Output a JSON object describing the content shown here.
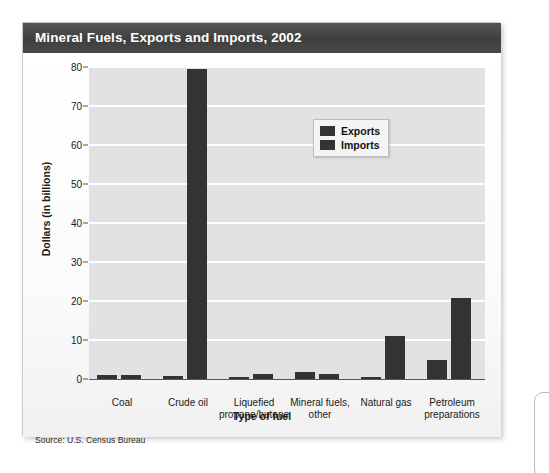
{
  "card": {
    "title": "Mineral Fuels, Exports and Imports, 2002",
    "source": "Source: U.S. Census Bureau"
  },
  "colors": {
    "bar": "#333333",
    "plot_background": "#e2e2e2",
    "gridline": "#ffffff",
    "title_bar": "#434343"
  },
  "chart_data": {
    "type": "bar",
    "title": "Mineral Fuels, Exports and Imports, 2002",
    "xlabel": "Type of fuel",
    "ylabel": "Dollars (in billions)",
    "categories": [
      "Coal",
      "Crude oil",
      "Liquefied propane/butane",
      "Mineral fuels, other",
      "Natural gas",
      "Petroleum preparations"
    ],
    "category_lines": [
      [
        "Coal"
      ],
      [
        "Crude oil"
      ],
      [
        "Liquefied",
        "propane/butane"
      ],
      [
        "Mineral fuels,",
        "other"
      ],
      [
        "Natural gas"
      ],
      [
        "Petroleum",
        "preparations"
      ]
    ],
    "series": [
      {
        "name": "Exports",
        "values": [
          1.0,
          0.8,
          0.3,
          1.8,
          0.3,
          5.0
        ]
      },
      {
        "name": "Imports",
        "values": [
          1.0,
          79.5,
          1.2,
          1.2,
          11.0,
          20.7
        ]
      }
    ],
    "ylim": [
      0,
      80
    ],
    "yticks": [
      0,
      10,
      20,
      30,
      40,
      50,
      60,
      70,
      80
    ],
    "ytick_labels": [
      "0",
      "10",
      "20",
      "30",
      "40",
      "50",
      "60",
      "70",
      "80"
    ],
    "grid": true,
    "legend_position": "top-center",
    "legend_entries": [
      "Exports",
      "Imports"
    ]
  }
}
